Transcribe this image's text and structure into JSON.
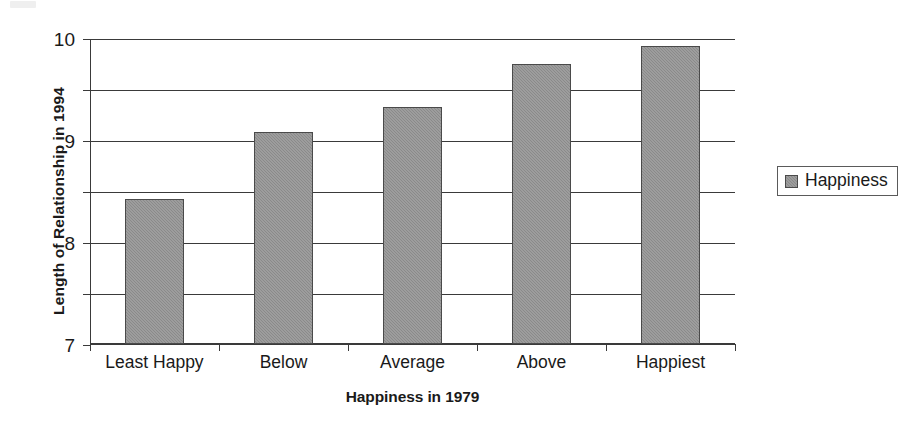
{
  "chart_data": {
    "type": "bar",
    "title": "",
    "xlabel": "Happiness in 1979",
    "ylabel": "Length of Relationship in 1994",
    "categories": [
      "Least Happy",
      "Below",
      "Average",
      "Above",
      "Happiest"
    ],
    "series": [
      {
        "name": "Happiness",
        "values": [
          6.85,
          8.15,
          8.65,
          9.5,
          9.85
        ],
        "color": "#8a8a8a"
      }
    ],
    "ylim": [
      4,
      10
    ],
    "yticks": [
      4,
      5,
      6,
      7,
      8,
      9,
      10
    ],
    "ytick_labels": [
      "4",
      "5",
      "6",
      "7",
      "8",
      "9",
      "10"
    ],
    "grid": true,
    "grid_axis": "y",
    "legend": {
      "position": "right",
      "entries": [
        {
          "label": "Happiness",
          "swatch_name": "legend-swatch-happiness"
        }
      ]
    }
  }
}
